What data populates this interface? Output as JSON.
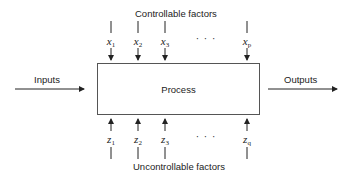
{
  "diagram": {
    "title_top": "Controllable factors",
    "title_bottom": "Uncontrollable factors",
    "process_label": "Process",
    "inputs_label": "Inputs",
    "outputs_label": "Outputs",
    "ellipsis": "· · ·",
    "controllable": [
      {
        "base": "x",
        "sub": "1"
      },
      {
        "base": "x",
        "sub": "2"
      },
      {
        "base": "x",
        "sub": "3"
      },
      {
        "base": "x",
        "sub": "p"
      }
    ],
    "uncontrollable": [
      {
        "base": "z",
        "sub": "1"
      },
      {
        "base": "z",
        "sub": "2"
      },
      {
        "base": "z",
        "sub": "3"
      },
      {
        "base": "z",
        "sub": "q"
      }
    ],
    "colors": {
      "line": "#222222",
      "box_border": "#555555",
      "background": "#ffffff"
    }
  }
}
